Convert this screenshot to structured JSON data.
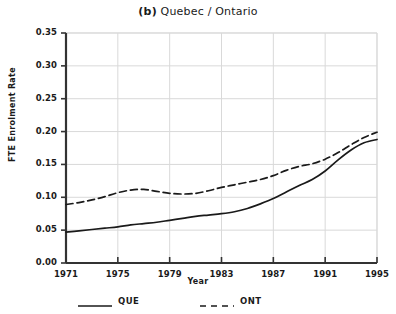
{
  "title": {
    "panel_letter": "(b)",
    "text": "Quebec / Ontario"
  },
  "axes": {
    "y_title": "FTE Enrolment Rate",
    "x_title": "Year",
    "y_ticks": [
      "0.00",
      "0.05",
      "0.10",
      "0.15",
      "0.20",
      "0.25",
      "0.30",
      "0.35"
    ],
    "x_ticks": [
      "1971",
      "1975",
      "1979",
      "1983",
      "1987",
      "1991",
      "1995"
    ]
  },
  "legend": {
    "entries": [
      {
        "label": "QUE",
        "style": "solid"
      },
      {
        "label": "ONT",
        "style": "dashed"
      }
    ]
  },
  "colors": {
    "line": "#1a1a1a",
    "grid": "#d9d9d9",
    "axis": "#333333",
    "background": "#ffffff"
  },
  "chart_data": {
    "type": "line",
    "title": "(b) Quebec / Ontario",
    "xlabel": "Year",
    "ylabel": "FTE Enrolment Rate",
    "xlim": [
      1971,
      1995
    ],
    "ylim": [
      0.0,
      0.35
    ],
    "ytick_values": [
      0.0,
      0.05,
      0.1,
      0.15,
      0.2,
      0.25,
      0.3,
      0.35
    ],
    "xtick_values": [
      1971,
      1975,
      1979,
      1983,
      1987,
      1991,
      1995
    ],
    "grid": true,
    "legend_position": "below-axes",
    "x": [
      1971,
      1972,
      1973,
      1974,
      1975,
      1976,
      1977,
      1978,
      1979,
      1980,
      1981,
      1982,
      1983,
      1984,
      1985,
      1986,
      1987,
      1988,
      1989,
      1990,
      1991,
      1992,
      1993,
      1994,
      1995
    ],
    "series": [
      {
        "name": "QUE",
        "style": "solid",
        "values": [
          0.047,
          0.049,
          0.051,
          0.053,
          0.055,
          0.058,
          0.06,
          0.062,
          0.065,
          0.068,
          0.071,
          0.073,
          0.075,
          0.078,
          0.083,
          0.09,
          0.098,
          0.108,
          0.118,
          0.127,
          0.14,
          0.157,
          0.172,
          0.183,
          0.188
        ]
      },
      {
        "name": "ONT",
        "style": "dashed",
        "values": [
          0.089,
          0.092,
          0.096,
          0.101,
          0.107,
          0.111,
          0.112,
          0.109,
          0.106,
          0.105,
          0.106,
          0.11,
          0.115,
          0.119,
          0.123,
          0.127,
          0.133,
          0.141,
          0.147,
          0.151,
          0.158,
          0.168,
          0.18,
          0.191,
          0.199
        ]
      }
    ]
  }
}
